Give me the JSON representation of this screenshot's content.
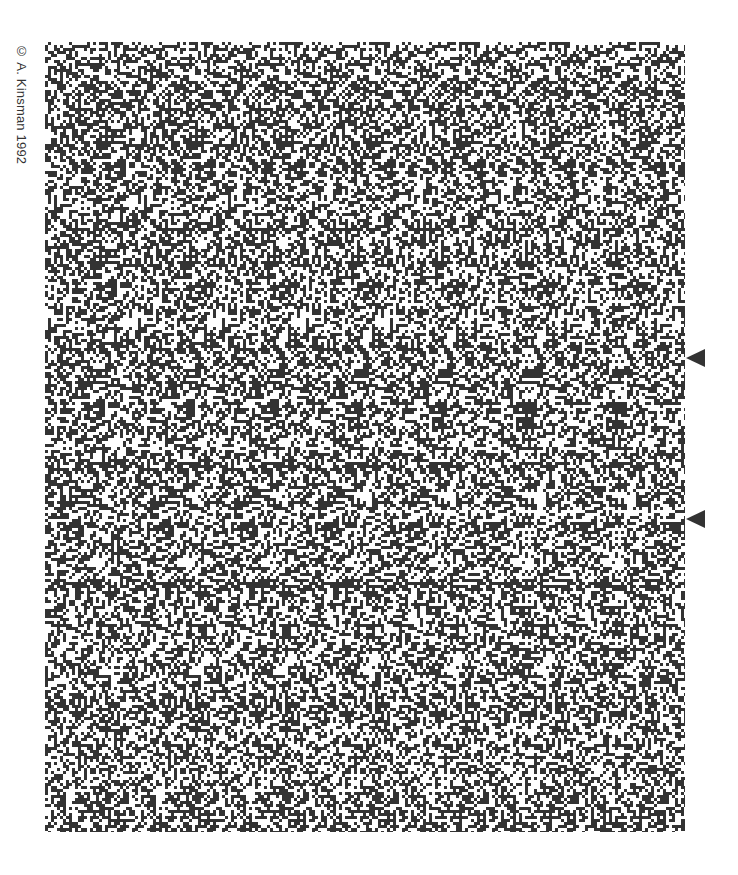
{
  "copyright": "© A. Kinsman 1992",
  "stereogram": {
    "dot_color": "#333333",
    "background": "#ffffff",
    "dot_size_px": 3,
    "density": 0.5,
    "region": {
      "x": 45,
      "y": 42,
      "width": 640,
      "height": 790
    }
  },
  "markers": [
    {
      "label": "alignment-marker-top",
      "x": 686,
      "y": 349
    },
    {
      "label": "alignment-marker-bottom",
      "x": 686,
      "y": 510
    }
  ]
}
